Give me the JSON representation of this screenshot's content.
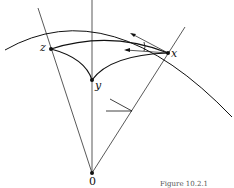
{
  "figure": {
    "labels": {
      "z": "z",
      "x": "x",
      "y": "y",
      "origin": "0"
    },
    "caption": "Figure 10.2.1",
    "colors": {
      "stroke": "#111111",
      "background": "#ffffff"
    },
    "points": {
      "origin": [
        92,
        173
      ],
      "y": [
        92,
        80
      ],
      "z": [
        51,
        49
      ],
      "x": [
        168,
        53
      ]
    }
  }
}
